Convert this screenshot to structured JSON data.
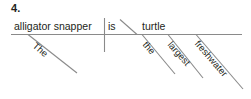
{
  "exercise": {
    "number": "4."
  },
  "diagram": {
    "type": "reed-kellogg-sentence-diagram",
    "baseline": {
      "color": "#8a8a8a"
    },
    "subject": {
      "label": "alligator snapper"
    },
    "verb": {
      "label": "is"
    },
    "complement": {
      "label": "turtle"
    },
    "modifiers": [
      {
        "label": "The",
        "attaches_to": "subject"
      },
      {
        "label": "the",
        "attaches_to": "complement"
      },
      {
        "label": "largest",
        "attaches_to": "complement"
      },
      {
        "label": "freshwater",
        "attaches_to": "complement"
      }
    ],
    "sentence": "The alligator snapper is the largest freshwater turtle."
  }
}
